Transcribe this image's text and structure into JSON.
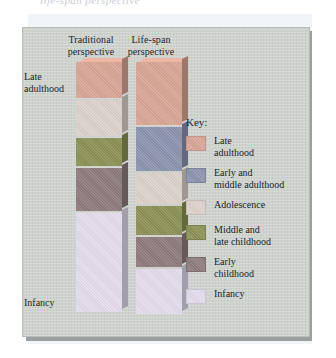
{
  "caption_sliver": "life-span perspective",
  "figure": {
    "columns": [
      {
        "id": "traditional",
        "label": "Traditional\nperspective"
      },
      {
        "id": "lifespan",
        "label": "Life-span\nperspective"
      }
    ],
    "axis_labels": {
      "top": "Late\nadulthood",
      "bottom": "Infancy"
    },
    "key_title": "Key:",
    "legend": [
      {
        "name": "late-adulthood",
        "label": "Late\nadulthood",
        "color": "#d8a595"
      },
      {
        "name": "early-middle-adulthood",
        "label": "Early and\nmiddle adulthood",
        "color": "#8b93ad"
      },
      {
        "name": "adolescence",
        "label": "Adolescence",
        "color": "#dcd2cb"
      },
      {
        "name": "middle-late-childhood",
        "label": "Middle and\nlate childhood",
        "color": "#8b9155"
      },
      {
        "name": "early-childhood",
        "label": "Early\nchildhood",
        "color": "#8d7b7d"
      },
      {
        "name": "infancy",
        "label": "Infancy",
        "color": "#e3dced"
      }
    ]
  },
  "chart_data": {
    "type": "bar",
    "title": "",
    "xlabel": "",
    "ylabel": "",
    "note": "Stacked vertical bars comparing how developmental periods are weighted; segment heights are proportional shares of the life span, top = late adulthood, bottom = infancy.",
    "categories": [
      "Traditional perspective",
      "Life-span perspective"
    ],
    "stages": [
      "Late adulthood",
      "Early and middle adulthood",
      "Adolescence",
      "Middle and late childhood",
      "Early childhood",
      "Infancy"
    ],
    "series": [
      {
        "name": "Traditional perspective",
        "segments": [
          {
            "stage": "Late adulthood",
            "height_px": 36,
            "color": "#d8a595"
          },
          {
            "stage": "Early and middle adulthood",
            "height_px": 0,
            "color": "#8b93ad"
          },
          {
            "stage": "Adolescence",
            "height_px": 36,
            "color": "#dcd2cb"
          },
          {
            "stage": "Middle and late childhood",
            "height_px": 28,
            "color": "#8b9155"
          },
          {
            "stage": "Early childhood",
            "height_px": 43,
            "color": "#8d7b7d"
          },
          {
            "stage": "Infancy",
            "height_px": 99,
            "color": "#e3dced"
          }
        ]
      },
      {
        "name": "Life-span perspective",
        "segments": [
          {
            "stage": "Late adulthood",
            "height_px": 63,
            "color": "#d8a595"
          },
          {
            "stage": "Early and middle adulthood",
            "height_px": 44,
            "color": "#8b93ad"
          },
          {
            "stage": "Adolescence",
            "height_px": 31,
            "color": "#dcd2cb"
          },
          {
            "stage": "Middle and late childhood",
            "height_px": 29,
            "color": "#8b9155"
          },
          {
            "stage": "Early childhood",
            "height_px": 30,
            "color": "#8d7b7d"
          },
          {
            "stage": "Infancy",
            "height_px": 45,
            "color": "#e3dced"
          }
        ]
      }
    ],
    "colors": {
      "panel_background": "#cfd3ce",
      "page_background": "#ffffff",
      "text": "#22252a"
    },
    "legend_position": "right",
    "grid": false
  }
}
